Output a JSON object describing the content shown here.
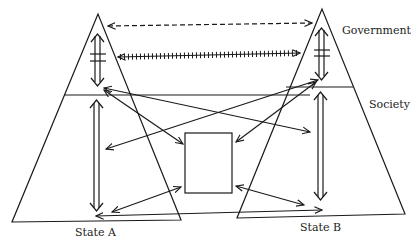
{
  "labels": {
    "government": "Government",
    "society": "Society",
    "state_a": "State A",
    "state_b": "State B"
  },
  "colors": {
    "line": "#1a1a1a",
    "background": "#ffffff"
  },
  "diagram": {
    "nodes": [
      {
        "id": "state-a",
        "type": "triangle",
        "label": "State A",
        "layers": [
          "Government",
          "Society"
        ]
      },
      {
        "id": "state-b",
        "type": "triangle",
        "label": "State B",
        "layers": [
          "Government",
          "Society"
        ]
      },
      {
        "id": "intermediary-box",
        "type": "rectangle",
        "label": ""
      }
    ],
    "edges": [
      {
        "from": "state-a.government",
        "to": "state-b.government",
        "style": "dashed",
        "direction": "both"
      },
      {
        "from": "state-a.government",
        "to": "state-b.government",
        "style": "hatched",
        "direction": "both"
      },
      {
        "from": "state-a.government",
        "to": "state-a.society",
        "style": "double-hatched",
        "direction": "both"
      },
      {
        "from": "state-b.government",
        "to": "state-b.society",
        "style": "double-hatched",
        "direction": "both"
      },
      {
        "from": "state-a.society-top",
        "to": "state-a.society-bottom",
        "style": "double",
        "direction": "both"
      },
      {
        "from": "state-b.society-top",
        "to": "state-b.society-bottom",
        "style": "double",
        "direction": "both"
      },
      {
        "from": "state-a.government",
        "to": "state-b.society",
        "style": "solid",
        "direction": "both"
      },
      {
        "from": "state-b.government",
        "to": "state-a.society",
        "style": "solid",
        "direction": "both"
      },
      {
        "from": "state-a.government",
        "to": "intermediary-box",
        "style": "solid",
        "direction": "both"
      },
      {
        "from": "state-b.government",
        "to": "intermediary-box",
        "style": "solid",
        "direction": "both"
      },
      {
        "from": "state-a.society",
        "to": "intermediary-box",
        "style": "solid",
        "direction": "both"
      },
      {
        "from": "state-b.society",
        "to": "intermediary-box",
        "style": "solid",
        "direction": "both"
      },
      {
        "from": "state-a.society",
        "to": "state-b.society",
        "style": "solid",
        "direction": "both"
      }
    ]
  }
}
